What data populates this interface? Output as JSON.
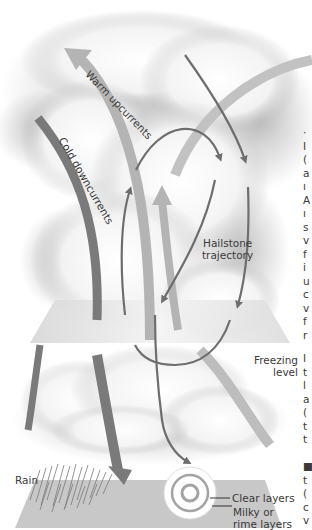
{
  "diagram": {
    "labels": {
      "warm_upcurrents": "Warm upcurrents",
      "cold_downcurrents": "Cold downcurrents",
      "hailstone_trajectory_1": "Hailstone",
      "hailstone_trajectory_2": "trajectory",
      "freezing_level_1": "Freezing",
      "freezing_level_2": "level",
      "rain": "Rain",
      "clear_layers": "Clear layers",
      "milky_layers_1": "Milky or",
      "milky_layers_2": "rime layers"
    },
    "colors": {
      "warm_upcurrent": "#b4b4b4",
      "cold_downcurrent": "#7a7a7a",
      "trajectory": "#6e6e6e",
      "ground_plane": "#c8c8c8",
      "freezing_plane": "#e6e6e6",
      "cloud_shadow": "#9a9a9a"
    },
    "side_text_fragments_top": [
      "·",
      "I",
      "(",
      "a",
      "ı",
      "A",
      "ı",
      "s",
      "v",
      "f",
      "i",
      "u",
      "c",
      "v",
      "f",
      "r"
    ],
    "side_text_fragments_bottom": [
      "I",
      "t",
      "l",
      "a",
      "(",
      "t",
      "t",
      "",
      "■",
      "t",
      "(",
      "c",
      "v"
    ]
  }
}
